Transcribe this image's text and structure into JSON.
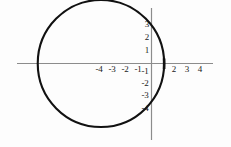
{
  "figure": {
    "name": "circle-graph",
    "background_color": "#fdfdfd",
    "width": 231,
    "height": 147
  },
  "chart_data": {
    "type": "scatter",
    "title": "",
    "subtitle": "",
    "xlabel": "",
    "ylabel": "",
    "xlim": [
      -6.2,
      5.4
    ],
    "ylim": [
      -5.0,
      4.9
    ],
    "grid": false,
    "legend": null,
    "axis_color": "#8c8c8c",
    "curve_color": "#111111",
    "label_color": "#1a1a1a",
    "x_tick_labels": [
      "-4",
      "-3",
      "-2",
      "-1",
      "2",
      "3",
      "4"
    ],
    "x_tick_values": [
      -4,
      -3,
      -2,
      -1,
      2,
      3,
      4
    ],
    "y_tick_labels": [
      "3",
      "2",
      "1",
      "-1",
      "-2",
      "-3",
      "-4"
    ],
    "y_tick_values": [
      3,
      2,
      1,
      -1,
      -2,
      -3,
      -4
    ],
    "shapes": [
      {
        "kind": "circle",
        "name": "circle-curve",
        "center_x": -4,
        "center_y": 0,
        "radius": 5,
        "stroke": "#111111",
        "stroke_width": 2,
        "fill": "none"
      }
    ],
    "annotations": [
      {
        "name": "x-axis-intercept-marker",
        "x": 1,
        "y": 0,
        "description": "thickened crossing of circle at positive x-axis"
      }
    ],
    "series": [
      {
        "name": "circle",
        "equation": "(x + 4)^2 + y^2 = 25",
        "x": [
          -9,
          -8,
          -7,
          -6,
          -5,
          -4,
          -3,
          -2,
          -1,
          0,
          1
        ],
        "y_upper": [
          0,
          3,
          4,
          4.8,
          5,
          5,
          4.9,
          4.6,
          4,
          3,
          0
        ],
        "y_lower": [
          0,
          -3,
          -4,
          -4.8,
          -5,
          -5,
          -4.9,
          -4.6,
          -4,
          -3,
          0
        ]
      }
    ]
  }
}
